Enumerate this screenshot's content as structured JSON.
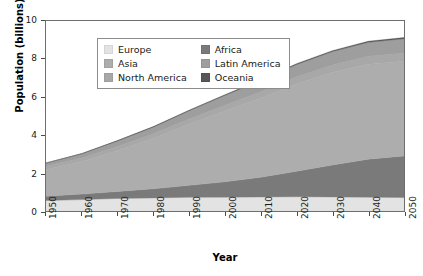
{
  "chart_data": {
    "type": "area",
    "title": "",
    "xlabel": "Year",
    "ylabel": "Population (billions)",
    "stacked": true,
    "grid": false,
    "legend_position": "top-left-inside",
    "xlim": [
      1950,
      2050
    ],
    "ylim": [
      0,
      10
    ],
    "yticks": [
      0,
      2,
      4,
      6,
      8,
      10
    ],
    "ytick_labels": [
      "0",
      "2",
      "4",
      "6",
      "8",
      "10"
    ],
    "x": [
      1950,
      1960,
      1970,
      1980,
      1990,
      2000,
      2010,
      2020,
      2030,
      2040,
      2050
    ],
    "xtick_labels": [
      "1950",
      "1960",
      "1970",
      "1980",
      "1990",
      "2000",
      "2010",
      "2020",
      "2030",
      "2040",
      "2050"
    ],
    "stack_order_bottom_to_top": [
      "Europe",
      "Africa",
      "Asia",
      "North America",
      "Latin America",
      "Oceania"
    ],
    "series": [
      {
        "name": "Europe",
        "color": "#e3e3e3",
        "values": [
          0.55,
          0.6,
          0.66,
          0.69,
          0.72,
          0.73,
          0.74,
          0.75,
          0.74,
          0.73,
          0.71
        ]
      },
      {
        "name": "Africa",
        "color": "#7a7a7a",
        "values": [
          0.23,
          0.29,
          0.37,
          0.48,
          0.63,
          0.81,
          1.04,
          1.34,
          1.68,
          2.0,
          2.19
        ]
      },
      {
        "name": "Asia",
        "color": "#adadad",
        "values": [
          1.4,
          1.7,
          2.14,
          2.64,
          3.21,
          3.72,
          4.16,
          4.6,
          4.87,
          5.0,
          4.98
        ]
      },
      {
        "name": "North America",
        "color": "#a8a8a8",
        "values": [
          0.17,
          0.2,
          0.23,
          0.25,
          0.28,
          0.31,
          0.34,
          0.37,
          0.4,
          0.42,
          0.44
        ]
      },
      {
        "name": "Latin America",
        "color": "#9e9e9e",
        "values": [
          0.17,
          0.22,
          0.29,
          0.36,
          0.44,
          0.52,
          0.59,
          0.65,
          0.7,
          0.73,
          0.75
        ]
      },
      {
        "name": "Oceania",
        "color": "#575757",
        "values": [
          0.013,
          0.016,
          0.02,
          0.023,
          0.027,
          0.031,
          0.037,
          0.043,
          0.048,
          0.053,
          0.057
        ]
      }
    ],
    "totals": [
      2.53,
      3.03,
      3.71,
      4.44,
      5.31,
      6.12,
      6.91,
      7.75,
      8.44,
      8.93,
      9.13
    ],
    "annotations": []
  },
  "legend": {
    "items": [
      {
        "label": "Europe",
        "swatch": "legend-swatch-europe"
      },
      {
        "label": "Africa",
        "swatch": "legend-swatch-africa"
      },
      {
        "label": "Asia",
        "swatch": "legend-swatch-asia"
      },
      {
        "label": "Latin America",
        "swatch": "legend-swatch-latin-america"
      },
      {
        "label": "North America",
        "swatch": "legend-swatch-north-america"
      },
      {
        "label": "Oceania",
        "swatch": "legend-swatch-oceania"
      }
    ]
  },
  "colors": {
    "europe": "#e3e3e3",
    "asia": "#adadad",
    "north_america": "#a8a8a8",
    "africa": "#7a7a7a",
    "latin_america": "#9e9e9e",
    "oceania": "#575757",
    "axis": "#6e6e6e",
    "text": "#1a1a1a",
    "background": "#ffffff"
  }
}
